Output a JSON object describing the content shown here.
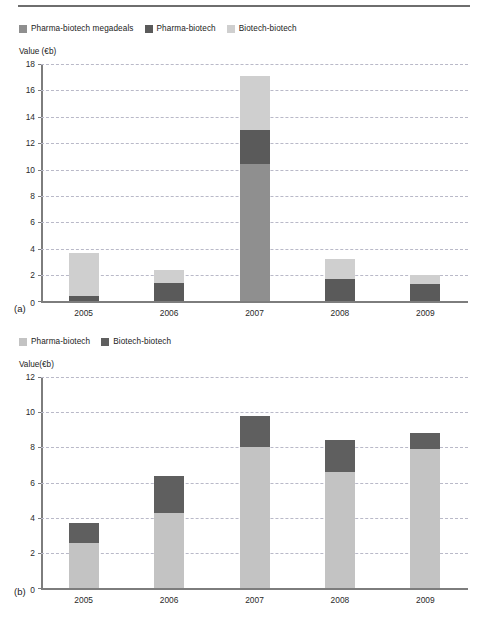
{
  "figure": {
    "panel_a_tag": "(a)",
    "panel_b_tag": "(b)"
  },
  "colors": {
    "megadeals": "#8f8f8f",
    "pharma_biotech_dark": "#5a5a5a",
    "biotech_biotech_light": "#cfcfcf",
    "pharma_biotech_light": "#c3c3c3",
    "biotech_biotech_dark": "#5f5f5f",
    "axis": "#7d7d7d",
    "grid": "#b9b9c8",
    "rule": "#6e6e6e"
  },
  "chart_data": [
    {
      "type": "bar",
      "id": "chart-a",
      "panel": "(a)",
      "title": "",
      "ylabel": "Value (€b)",
      "xlabel": "",
      "ylim": [
        0,
        18
      ],
      "yticks": [
        0,
        2,
        4,
        6,
        8,
        10,
        12,
        14,
        16,
        18
      ],
      "ytick_labels": [
        "0",
        "2",
        "4",
        "6",
        "8",
        "10",
        "12",
        "14",
        "16",
        "18"
      ],
      "grid": true,
      "stacked": true,
      "legend_position": "top-left",
      "categories": [
        "2005",
        "2006",
        "2007",
        "2008",
        "2009"
      ],
      "series": [
        {
          "name": "Pharma-biotech megadeals",
          "color_key": "megadeals",
          "values": [
            0.0,
            0.0,
            10.4,
            0.0,
            0.0
          ]
        },
        {
          "name": "Pharma-biotech",
          "color_key": "pharma_biotech_dark",
          "values": [
            0.4,
            1.4,
            2.6,
            1.7,
            1.3
          ]
        },
        {
          "name": "Biotech-biotech",
          "color_key": "biotech_biotech_light",
          "values": [
            3.3,
            1.0,
            4.1,
            1.5,
            0.7
          ]
        }
      ],
      "totals": [
        3.7,
        2.4,
        17.1,
        3.2,
        2.0
      ]
    },
    {
      "type": "bar",
      "id": "chart-b",
      "panel": "(b)",
      "title": "",
      "ylabel": "Value(€b)",
      "xlabel": "",
      "ylim": [
        0,
        12
      ],
      "yticks": [
        0,
        2,
        4,
        6,
        8,
        10,
        12
      ],
      "ytick_labels": [
        "0",
        "2",
        "4",
        "6",
        "8",
        "10",
        "12"
      ],
      "grid": true,
      "stacked": true,
      "legend_position": "top-left",
      "categories": [
        "2005",
        "2006",
        "2007",
        "2008",
        "2009"
      ],
      "series": [
        {
          "name": "Pharma-biotech",
          "color_key": "pharma_biotech_light",
          "values": [
            2.6,
            4.3,
            8.0,
            6.6,
            7.9
          ]
        },
        {
          "name": "Biotech-biotech",
          "color_key": "biotech_biotech_dark",
          "values": [
            1.1,
            2.1,
            1.8,
            1.8,
            0.9
          ]
        }
      ],
      "totals": [
        3.7,
        6.4,
        9.8,
        8.4,
        8.8
      ]
    }
  ]
}
